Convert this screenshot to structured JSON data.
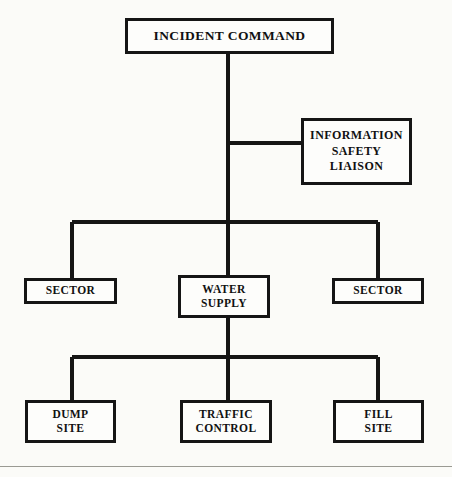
{
  "diagram": {
    "background_color": "#fbfbf8",
    "line_color": "#151515",
    "box_fill_color": "#fdfdfb",
    "nodes": {
      "incident_command": {
        "lines": [
          "INCIDENT COMMAND"
        ]
      },
      "info_safety_liaison": {
        "lines": [
          "INFORMATION",
          "SAFETY",
          "LIAISON"
        ]
      },
      "sector_left": {
        "lines": [
          "SECTOR"
        ]
      },
      "water_supply": {
        "lines": [
          "WATER",
          "SUPPLY"
        ]
      },
      "sector_right": {
        "lines": [
          "SECTOR"
        ]
      },
      "dump_site": {
        "lines": [
          "DUMP",
          "SITE"
        ]
      },
      "traffic_control": {
        "lines": [
          "TRAFFIC",
          "CONTROL"
        ]
      },
      "fill_site": {
        "lines": [
          "FILL",
          "SITE"
        ]
      }
    }
  }
}
